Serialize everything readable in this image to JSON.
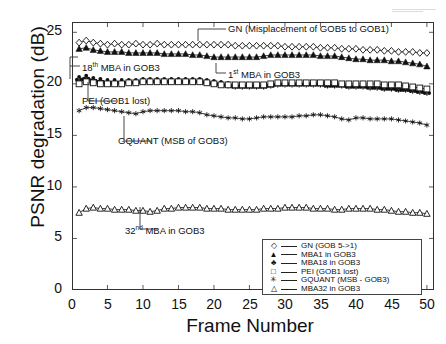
{
  "chart_data": {
    "type": "line",
    "title": "",
    "xlabel": "Frame Number",
    "ylabel": "PSNR degradation (dB)",
    "xlim": [
      0,
      51
    ],
    "ylim": [
      0,
      26
    ],
    "xticks": [
      0,
      5,
      10,
      15,
      20,
      25,
      30,
      35,
      40,
      45,
      50
    ],
    "yticks": [
      0,
      5,
      10,
      15,
      20,
      25
    ],
    "grid": false,
    "legend_position": "bottom-right",
    "x": [
      1,
      2,
      3,
      4,
      5,
      6,
      7,
      8,
      9,
      10,
      11,
      12,
      13,
      14,
      15,
      16,
      17,
      18,
      19,
      20,
      21,
      22,
      23,
      24,
      25,
      26,
      27,
      28,
      29,
      30,
      31,
      32,
      33,
      34,
      35,
      36,
      37,
      38,
      39,
      40,
      41,
      42,
      43,
      44,
      45,
      46,
      47,
      48,
      49,
      50
    ],
    "series": [
      {
        "name": "GN (GOB 5->1)",
        "marker": "diamond-open",
        "values": [
          24.0,
          24.2,
          24.0,
          23.9,
          23.8,
          23.9,
          23.8,
          23.8,
          23.9,
          23.8,
          23.8,
          23.9,
          23.8,
          23.8,
          23.8,
          23.8,
          23.8,
          23.8,
          23.8,
          23.8,
          23.8,
          23.8,
          23.7,
          23.7,
          23.7,
          23.7,
          23.7,
          23.7,
          23.7,
          23.6,
          23.6,
          23.6,
          23.6,
          23.6,
          23.5,
          23.5,
          23.5,
          23.4,
          23.4,
          23.4,
          23.3,
          23.3,
          23.3,
          23.2,
          23.2,
          23.1,
          23.1,
          23.1,
          23.0,
          23.0
        ]
      },
      {
        "name": "MBA1 in GOB3",
        "marker": "triangle-filled",
        "values": [
          23.4,
          23.5,
          23.3,
          23.2,
          23.1,
          23.1,
          23.1,
          23.0,
          23.0,
          23.0,
          23.0,
          23.0,
          22.9,
          22.9,
          22.9,
          22.9,
          22.8,
          22.8,
          22.7,
          22.6,
          22.6,
          22.6,
          22.6,
          22.6,
          22.6,
          22.6,
          22.7,
          22.8,
          22.8,
          22.8,
          22.8,
          22.8,
          22.8,
          22.8,
          22.7,
          22.7,
          22.7,
          22.6,
          22.5,
          22.4,
          22.4,
          22.3,
          22.3,
          22.3,
          22.2,
          22.2,
          22.1,
          22.0,
          21.9,
          21.7
        ]
      },
      {
        "name": "MBA18 in GOB3",
        "marker": "club-filled",
        "values": [
          20.5,
          20.6,
          20.4,
          20.3,
          20.2,
          20.2,
          20.2,
          20.2,
          20.2,
          20.3,
          20.3,
          20.3,
          20.3,
          20.3,
          20.3,
          20.3,
          20.3,
          20.3,
          20.2,
          20.1,
          20.0,
          19.9,
          19.8,
          19.8,
          19.8,
          19.8,
          19.8,
          19.9,
          20.0,
          20.0,
          20.0,
          20.0,
          20.0,
          20.0,
          20.0,
          19.9,
          19.9,
          19.9,
          19.8,
          19.8,
          19.8,
          19.7,
          19.7,
          19.6,
          19.6,
          19.5,
          19.5,
          19.4,
          19.3,
          19.2
        ]
      },
      {
        "name": "PEI (GOB1 lost)",
        "marker": "square-open",
        "values": [
          20.0,
          20.2,
          20.1,
          20.0,
          20.0,
          20.0,
          20.0,
          20.1,
          20.1,
          20.2,
          20.2,
          20.2,
          20.2,
          20.2,
          20.2,
          20.2,
          20.2,
          20.2,
          20.1,
          20.0,
          19.9,
          19.9,
          19.9,
          19.9,
          19.9,
          19.9,
          19.9,
          20.0,
          20.1,
          20.1,
          20.1,
          20.1,
          20.1,
          20.1,
          20.1,
          20.1,
          20.1,
          20.0,
          20.0,
          20.0,
          20.0,
          20.0,
          20.0,
          19.9,
          19.9,
          19.9,
          19.8,
          19.7,
          19.6,
          19.5
        ]
      },
      {
        "name": "GQUANT (MSB - GOB3)",
        "marker": "star-small",
        "values": [
          17.4,
          17.7,
          17.7,
          17.6,
          17.5,
          17.4,
          17.3,
          17.2,
          17.1,
          17.3,
          17.4,
          17.4,
          17.4,
          17.4,
          17.4,
          17.3,
          17.3,
          17.2,
          17.0,
          16.9,
          16.8,
          16.7,
          16.7,
          16.6,
          16.6,
          16.7,
          16.8,
          16.8,
          16.8,
          16.8,
          16.8,
          16.9,
          16.9,
          17.0,
          17.0,
          16.9,
          16.8,
          16.6,
          16.5,
          16.7,
          16.7,
          16.6,
          16.6,
          16.6,
          16.6,
          16.5,
          16.4,
          16.3,
          16.2,
          16.0
        ]
      },
      {
        "name": "MBA32 in GOB3",
        "marker": "triangle-open",
        "values": [
          7.5,
          7.9,
          8.0,
          7.9,
          7.9,
          7.8,
          7.8,
          7.8,
          7.7,
          7.7,
          7.6,
          7.7,
          7.9,
          7.9,
          8.0,
          8.0,
          8.0,
          8.0,
          7.9,
          7.9,
          7.9,
          7.8,
          7.8,
          7.8,
          7.8,
          7.8,
          7.9,
          7.9,
          7.9,
          8.0,
          8.0,
          8.0,
          8.0,
          7.9,
          7.9,
          7.9,
          7.8,
          7.8,
          7.9,
          7.9,
          7.9,
          7.9,
          7.8,
          7.8,
          7.7,
          7.6,
          7.6,
          7.5,
          7.5,
          7.4
        ]
      }
    ]
  },
  "annotations": [
    {
      "id": "gn-annotation",
      "text_pre": "GN (Misplacement of GOB5 to GOB1)",
      "sup": "",
      "text_post": ""
    },
    {
      "id": "mba18-annotation",
      "text_pre": "18",
      "sup": "th",
      "text_post": " MBA in GOB3"
    },
    {
      "id": "mba1-annotation",
      "text_pre": "1",
      "sup": "st",
      "text_post": " MBA in GOB3"
    },
    {
      "id": "pei-annotation",
      "text_pre": "PEI (GOB1 lost)",
      "sup": "",
      "text_post": ""
    },
    {
      "id": "gquant-annotation",
      "text_pre": "GQUANT (MSB of GOB3)",
      "sup": "",
      "text_post": ""
    },
    {
      "id": "mba32-annotation",
      "text_pre": "32",
      "sup": "nd",
      "text_post": " MBA in GOB3"
    }
  ],
  "legend": {
    "items": [
      {
        "symbol": "◇",
        "label": "GN (GOB 5->1)"
      },
      {
        "symbol": "▲",
        "label": "MBA1 in GOB3"
      },
      {
        "symbol": "♣",
        "label": "MBA18 in GOB3"
      },
      {
        "symbol": "□",
        "label": "PEI (GOB1 lost)"
      },
      {
        "symbol": "✳",
        "label": "GQUANT (MSB - GOB3)"
      },
      {
        "symbol": "△",
        "label": "MBA32 in GOB3"
      }
    ]
  },
  "axis_text": {
    "y_title": "PSNR degradation (dB)",
    "x_title": "Frame Number",
    "yticks": [
      "0",
      "5",
      "10",
      "15",
      "20",
      "25"
    ],
    "xticks": [
      "0",
      "5",
      "10",
      "15",
      "20",
      "25",
      "30",
      "35",
      "40",
      "45",
      "50"
    ]
  },
  "colors": {
    "axis": "#222222",
    "data": "#111111",
    "background": "#ffffff"
  }
}
